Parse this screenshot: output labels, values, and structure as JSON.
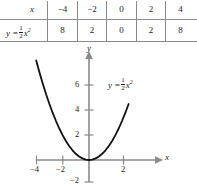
{
  "table": {
    "header_label": "x",
    "row_label_prefix": "y =",
    "row_label_coefficient_num": "1",
    "row_label_coefficient_den": "2",
    "row_label_variable": "x",
    "row_label_exponent": "2",
    "x_values": [
      "−4",
      "−2",
      "0",
      "2",
      "4"
    ],
    "y_values": [
      "8",
      "2",
      "0",
      "2",
      "8"
    ]
  },
  "graph": {
    "y_axis_label": "y",
    "x_axis_label": "x",
    "curve_label_prefix": "y =",
    "curve_label_num": "1",
    "curve_label_den": "2",
    "curve_label_variable": "x",
    "curve_label_exponent": "2",
    "x_tick_labels": [
      "−4",
      "−2",
      "2"
    ],
    "y_tick_labels": [
      "6",
      "4",
      "2",
      "−2"
    ]
  },
  "chart_data": {
    "type": "line",
    "title": "",
    "xlabel": "x",
    "ylabel": "y",
    "equation": "y = (1/2)x^2",
    "xlim": [
      -4.6,
      3.1
    ],
    "ylim": [
      -2.4,
      8.4
    ],
    "xticks": [
      -4,
      -2,
      2
    ],
    "yticks": [
      -2,
      2,
      4,
      6
    ],
    "grid": false,
    "legend": "none",
    "annotations": [
      "y = 1/2 x^2"
    ],
    "table": {
      "columns": [
        "x",
        "y = 1/2 x^2"
      ],
      "x": [
        -4,
        -2,
        0,
        2,
        4
      ],
      "y": [
        8,
        2,
        0,
        2,
        8
      ]
    },
    "series": [
      {
        "name": "y = 1/2 x^2",
        "x": [
          -4.0,
          -3.75,
          -3.5,
          -3.25,
          -3.0,
          -2.75,
          -2.5,
          -2.25,
          -2.0,
          -1.75,
          -1.5,
          -1.25,
          -1.0,
          -0.75,
          -0.5,
          -0.25,
          0.0,
          0.25,
          0.5,
          0.75,
          1.0,
          1.25,
          1.5,
          1.75,
          2.0,
          2.25,
          2.5,
          2.75,
          3.0
        ],
        "y": [
          8.0,
          7.03,
          6.13,
          5.28,
          4.5,
          3.78,
          3.13,
          2.53,
          2.0,
          1.53,
          1.13,
          0.78,
          0.5,
          0.28,
          0.13,
          0.03,
          0.0,
          0.03,
          0.13,
          0.28,
          0.5,
          0.78,
          1.13,
          1.53,
          2.0,
          2.53,
          3.13,
          3.78,
          4.5
        ]
      }
    ]
  },
  "colors": {
    "curve": "#111111",
    "axis": "#8a8a8a",
    "rule": "#8a8a8a",
    "text": "#1a1a1a",
    "background": "#ffffff"
  }
}
